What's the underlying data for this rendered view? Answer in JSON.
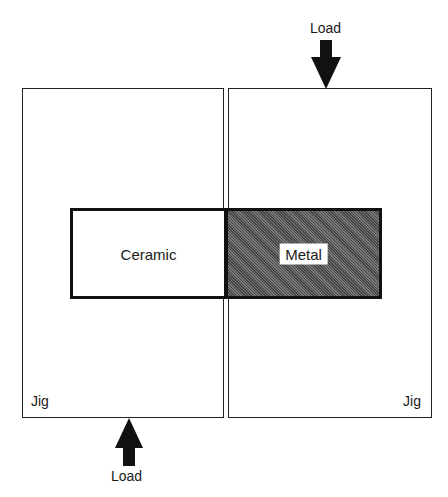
{
  "diagram": {
    "jigs": [
      {
        "id": "left",
        "label": "Jig"
      },
      {
        "id": "right",
        "label": "Jig"
      }
    ],
    "specimens": [
      {
        "id": "ceramic",
        "label": "Ceramic",
        "fill": "#ffffff"
      },
      {
        "id": "metal",
        "label": "Metal",
        "fill": "#555555"
      }
    ],
    "loads": [
      {
        "position": "top",
        "direction": "down",
        "label": "Load"
      },
      {
        "position": "bottom",
        "direction": "up",
        "label": "Load"
      }
    ]
  }
}
